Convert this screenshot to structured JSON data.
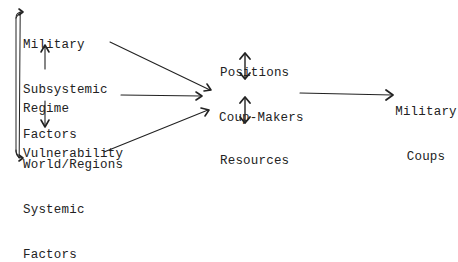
{
  "diagram": {
    "nodes": {
      "military_subsystemic": {
        "lines": [
          "Military",
          "Subsystemic",
          "Factors"
        ]
      },
      "regime_vulnerability": {
        "lines": [
          "Regime",
          "Vulnerability"
        ]
      },
      "world_systemic": {
        "lines": [
          "World/Regions",
          "Systemic",
          "Factors"
        ]
      },
      "positions": {
        "label": "Positions"
      },
      "coup_makers": {
        "label": "Coup-Makers"
      },
      "resources": {
        "label": "Resources"
      },
      "military_coups": {
        "lines": [
          "Military",
          "Coups"
        ]
      }
    },
    "edges": [
      {
        "from": "military_subsystemic",
        "to": "coup_makers",
        "type": "arrow"
      },
      {
        "from": "regime_vulnerability",
        "to": "coup_makers",
        "type": "arrow"
      },
      {
        "from": "world_systemic",
        "to": "coup_makers",
        "type": "arrow"
      },
      {
        "from": "regime_vulnerability",
        "to": "military_subsystemic",
        "type": "arrow"
      },
      {
        "from": "regime_vulnerability",
        "to": "world_systemic",
        "type": "arrow"
      },
      {
        "from": "military_subsystemic",
        "to": "world_systemic",
        "type": "bidirectional"
      },
      {
        "from": "positions",
        "to": "coup_makers",
        "type": "bidirectional"
      },
      {
        "from": "resources",
        "to": "coup_makers",
        "type": "bidirectional"
      },
      {
        "from": "coup_makers",
        "to": "military_coups",
        "type": "arrow"
      }
    ],
    "colors": {
      "ink": "#222222",
      "background": "#ffffff"
    }
  }
}
